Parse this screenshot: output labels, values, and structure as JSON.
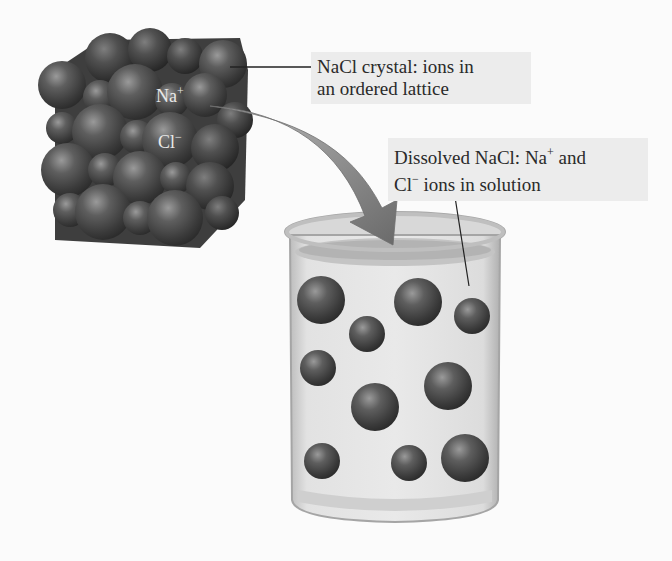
{
  "figure": {
    "type": "NaCl dissolution diagram",
    "background_color": "#fbfbfb",
    "label_box_color": "#ececec",
    "ion_color": "#4a4a4a"
  },
  "crystal": {
    "description": "NaCl crystal lattice of packed spheres",
    "ion_labels": {
      "sodium": {
        "base": "Na",
        "charge": "+"
      },
      "chloride": {
        "base": "Cl",
        "charge": "−"
      }
    }
  },
  "labels": {
    "crystal": {
      "line1": "NaCl crystal: ions in",
      "line2": "an ordered lattice"
    },
    "dissolved": {
      "line1_prefix": "Dissolved NaCl: Na",
      "line1_sup": "+",
      "line1_suffix": " and",
      "line2_prefix": "Cl",
      "line2_sup": "−",
      "line2_suffix": " ions in solution"
    }
  },
  "arrow": {
    "description": "curved arrow from crystal into beaker",
    "color": "#7a7a7a"
  },
  "beaker": {
    "description": "glass beaker of water containing dispersed ions",
    "ion_count": 11
  }
}
